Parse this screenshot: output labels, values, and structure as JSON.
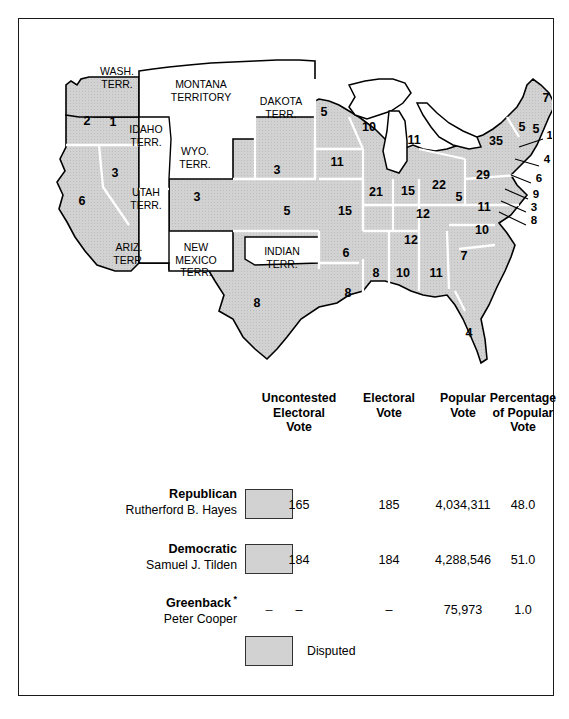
{
  "map": {
    "title": "Election of 1876 electoral map",
    "colors": {
      "disputed_fill": "#d2d2d2",
      "territory_fill": "#ffffff",
      "outline": "#000000",
      "state_border": "#ffffff"
    },
    "territories": [
      {
        "name": "WASH.\nTERR.",
        "x": 98,
        "y": 56
      },
      {
        "name": "MONTANA\nTERRITORY",
        "x": 182,
        "y": 69
      },
      {
        "name": "DAKOTA\nTERR.",
        "x": 262,
        "y": 86
      },
      {
        "name": "IDAHO\nTERR.",
        "x": 127,
        "y": 114
      },
      {
        "name": "WYO.\nTERR.",
        "x": 176,
        "y": 136
      },
      {
        "name": "UTAH\nTERR.",
        "x": 127,
        "y": 177
      },
      {
        "name": "ARIZ.\nTERR.",
        "x": 110,
        "y": 232
      },
      {
        "name": "NEW\nMEXICO\nTERR.",
        "x": 177,
        "y": 232
      },
      {
        "name": "INDIAN\nTERR.",
        "x": 263,
        "y": 236
      }
    ],
    "electoral_votes": [
      {
        "state": "Oregon-north",
        "value": "2",
        "x": 68,
        "y": 106
      },
      {
        "state": "Oregon-south",
        "value": "1",
        "x": 94,
        "y": 107
      },
      {
        "state": "Nevada",
        "value": "3",
        "x": 96,
        "y": 158
      },
      {
        "state": "California",
        "value": "6",
        "x": 63,
        "y": 186
      },
      {
        "state": "Colorado",
        "value": "3",
        "x": 178,
        "y": 182
      },
      {
        "state": "Nebraska",
        "value": "3",
        "x": 258,
        "y": 155
      },
      {
        "state": "Kansas",
        "value": "5",
        "x": 268,
        "y": 196
      },
      {
        "state": "Texas",
        "value": "8",
        "x": 238,
        "y": 288
      },
      {
        "state": "Minnesota",
        "value": "5",
        "x": 305,
        "y": 97
      },
      {
        "state": "Wisconsin",
        "value": "10",
        "x": 350,
        "y": 112
      },
      {
        "state": "Michigan",
        "value": "11",
        "x": 395,
        "y": 125
      },
      {
        "state": "Iowa",
        "value": "11",
        "x": 318,
        "y": 147
      },
      {
        "state": "Illinois",
        "value": "21",
        "x": 357,
        "y": 177
      },
      {
        "state": "Indiana",
        "value": "15",
        "x": 389,
        "y": 176
      },
      {
        "state": "Ohio",
        "value": "22",
        "x": 420,
        "y": 170
      },
      {
        "state": "Pennsylvania",
        "value": "29",
        "x": 464,
        "y": 160
      },
      {
        "state": "New York",
        "value": "35",
        "x": 477,
        "y": 126
      },
      {
        "state": "Maine",
        "value": "7",
        "x": 527,
        "y": 83
      },
      {
        "state": "Vermont",
        "value": "5",
        "x": 503,
        "y": 112
      },
      {
        "state": "New Hampshire",
        "value": "5",
        "x": 517,
        "y": 114
      },
      {
        "state": "Missouri",
        "value": "15",
        "x": 326,
        "y": 196
      },
      {
        "state": "Kentucky",
        "value": "12",
        "x": 404,
        "y": 199
      },
      {
        "state": "West Virginia",
        "value": "5",
        "x": 440,
        "y": 182
      },
      {
        "state": "Virginia",
        "value": "11",
        "x": 465,
        "y": 192
      },
      {
        "state": "Tennessee",
        "value": "12",
        "x": 392,
        "y": 225
      },
      {
        "state": "North Carolina",
        "value": "10",
        "x": 463,
        "y": 215
      },
      {
        "state": "Arkansas",
        "value": "6",
        "x": 327,
        "y": 238
      },
      {
        "state": "South Carolina",
        "value": "7",
        "x": 445,
        "y": 241
      },
      {
        "state": "Mississippi",
        "value": "8",
        "x": 357,
        "y": 258
      },
      {
        "state": "Alabama",
        "value": "10",
        "x": 384,
        "y": 258
      },
      {
        "state": "Georgia",
        "value": "11",
        "x": 417,
        "y": 258
      },
      {
        "state": "Louisiana",
        "value": "8",
        "x": 329,
        "y": 278
      },
      {
        "state": "Florida",
        "value": "4",
        "x": 450,
        "y": 318
      }
    ],
    "callouts": [
      {
        "state": "Massachusetts",
        "value": "13",
        "x": 534,
        "y": 120
      },
      {
        "state": "Rhode Island",
        "value": "4",
        "x": 528,
        "y": 144
      },
      {
        "state": "Connecticut",
        "value": "6",
        "x": 520,
        "y": 163
      },
      {
        "state": "New Jersey",
        "value": "9",
        "x": 517,
        "y": 179
      },
      {
        "state": "Delaware",
        "value": "3",
        "x": 515,
        "y": 192
      },
      {
        "state": "Maryland",
        "value": "8",
        "x": 515,
        "y": 205
      }
    ]
  },
  "table": {
    "headers": [
      {
        "text": "Uncontested\nElectoral\nVote",
        "x": 232,
        "width": 96
      },
      {
        "text": "Electoral\nVote",
        "x": 334,
        "width": 72
      },
      {
        "text": "Popular\nVote",
        "x": 406,
        "width": 76
      },
      {
        "text": "Percentage\nof Popular\nVote",
        "x": 456,
        "width": 96
      }
    ],
    "rows": [
      {
        "party": "Republican",
        "candidate": "Rutherford B. Hayes",
        "has_swatch": true,
        "swatch_color": "#d2d2d2",
        "uncontested_electoral_vote": "165",
        "electoral_vote": "185",
        "popular_vote": "4,034,311",
        "percentage_of_popular_vote": "48.0"
      },
      {
        "party": "Democratic",
        "candidate": "Samuel J. Tilden",
        "has_swatch": true,
        "swatch_color": "#d2d2d2",
        "uncontested_electoral_vote": "184",
        "electoral_vote": "184",
        "popular_vote": "4,288,546",
        "percentage_of_popular_vote": "51.0"
      },
      {
        "party": "Greenback",
        "party_marker": "*",
        "candidate": "Peter Cooper",
        "has_swatch": false,
        "swatch_dash": "–",
        "uncontested_electoral_vote": "–",
        "electoral_vote": "–",
        "popular_vote": "75,973",
        "percentage_of_popular_vote": "1.0"
      }
    ],
    "legend": {
      "label": "Disputed",
      "swatch_color": "#d2d2d2"
    }
  }
}
